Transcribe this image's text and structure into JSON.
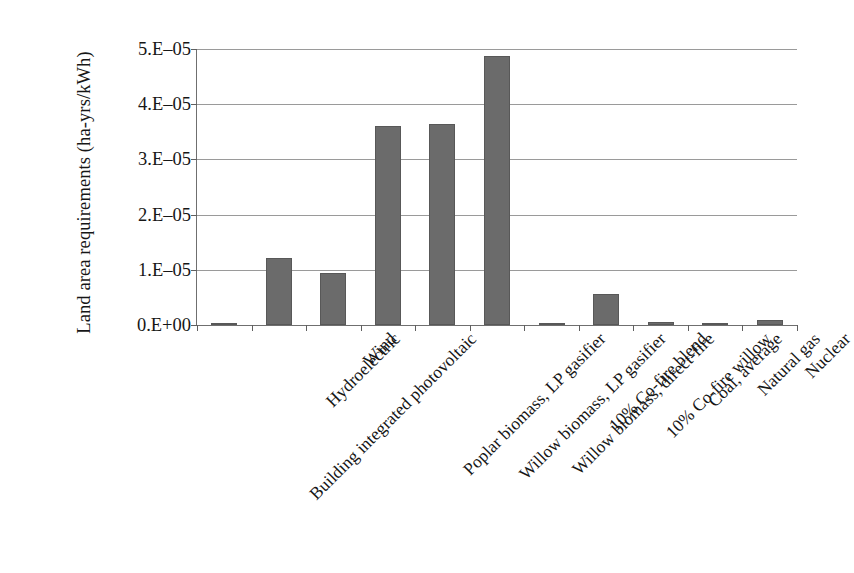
{
  "chart_data": {
    "type": "bar",
    "title": "",
    "xlabel": "",
    "ylabel": "Land area requirements (ha-yrs/kWh)",
    "ylim": [
      0,
      5e-05
    ],
    "grid": true,
    "legend": "none",
    "y_tick_labels": [
      "5.E–05",
      "4.E–05",
      "3.E–05",
      "2.E–05",
      "1.E–05",
      "0.E+00"
    ],
    "y_tick_values": [
      5e-05,
      4e-05,
      3e-05,
      2e-05,
      1e-05,
      0
    ],
    "categories": [
      "Building integrated photovoltaic",
      "Hydroelectric",
      "Wind",
      "Poplar biomass, LP gasifier",
      "Willow biomass, LP gasifier",
      "Willow biomass, direct-fire",
      "10% Co-fire blend",
      "10% Co-fire willow",
      "Coal, average",
      "Natural gas",
      "Nuclear"
    ],
    "values": [
      4e-07,
      1.22e-05,
      9.5e-06,
      3.6e-05,
      3.65e-05,
      4.88e-05,
      3.5e-07,
      5.6e-06,
      5e-07,
      5e-08,
      9e-07
    ],
    "bar_color": "#6b6b6b",
    "gridline_color": "#9a9a9a",
    "axis_color": "#6f6f6f",
    "text_color": "#161616"
  }
}
